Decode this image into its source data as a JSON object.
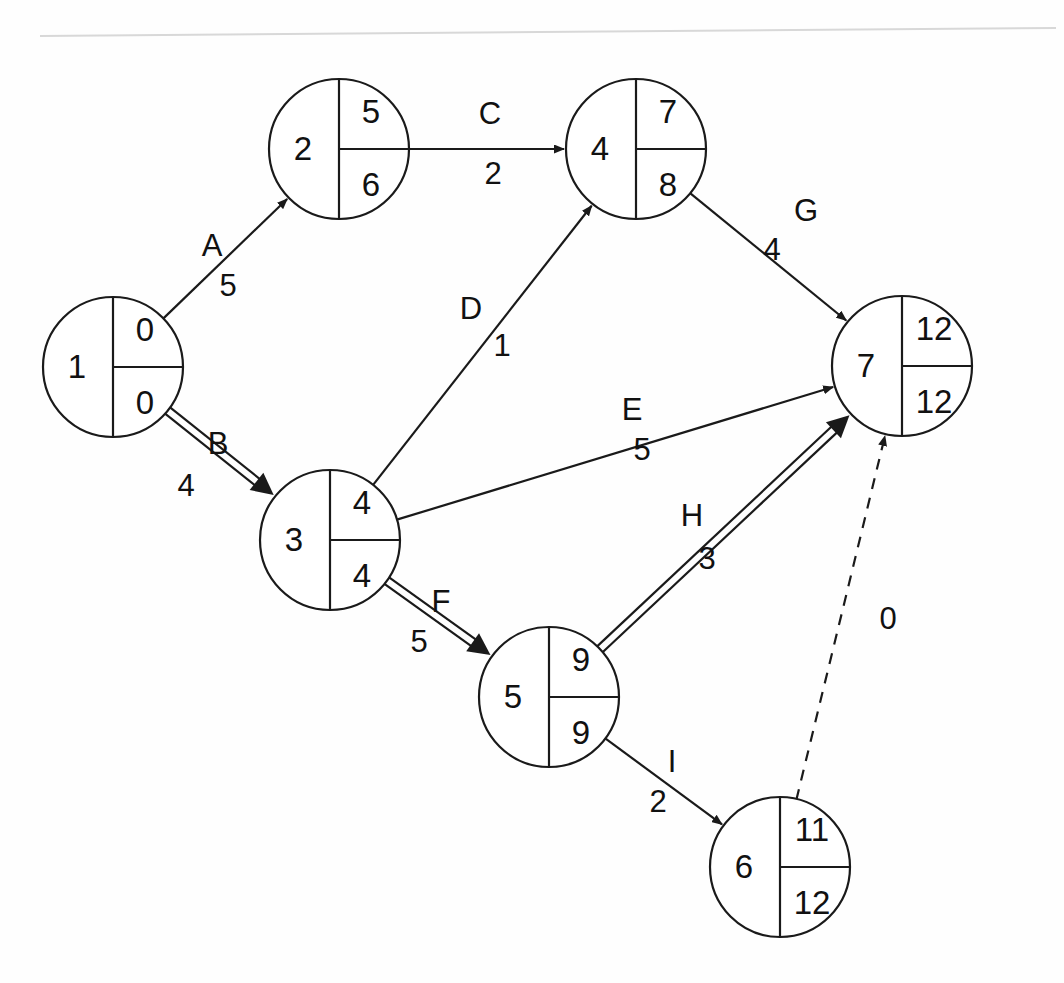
{
  "diagram": {
    "type": "aoa-network",
    "page_rule_visible": "true",
    "nodes": [
      {
        "id": "1",
        "label": "1",
        "early": "0",
        "late": "0",
        "cx": 113,
        "cy": 367,
        "r": 70
      },
      {
        "id": "2",
        "label": "2",
        "early": "5",
        "late": "6",
        "cx": 339,
        "cy": 149,
        "r": 70
      },
      {
        "id": "3",
        "label": "3",
        "early": "4",
        "late": "4",
        "cx": 330,
        "cy": 540,
        "r": 70
      },
      {
        "id": "4",
        "label": "4",
        "early": "7",
        "late": "8",
        "cx": 636,
        "cy": 149,
        "r": 70
      },
      {
        "id": "5",
        "label": "5",
        "early": "9",
        "late": "9",
        "cx": 549,
        "cy": 697,
        "r": 70
      },
      {
        "id": "6",
        "label": "6",
        "early": "11",
        "late": "12",
        "cx": 780,
        "cy": 867,
        "r": 70
      },
      {
        "id": "7",
        "label": "7",
        "early": "12",
        "late": "12",
        "cx": 902,
        "cy": 366,
        "r": 70
      }
    ],
    "edges": [
      {
        "id": "A",
        "label": "A",
        "duration": "5",
        "from": "1",
        "to": "2",
        "style": "single",
        "label_x": 212,
        "label_y": 248,
        "dur_x": 228,
        "dur_y": 288
      },
      {
        "id": "B",
        "label": "B",
        "duration": "4",
        "from": "1",
        "to": "3",
        "style": "double",
        "label_x": 218,
        "label_y": 446,
        "dur_x": 186,
        "dur_y": 488
      },
      {
        "id": "C",
        "label": "C",
        "duration": "2",
        "from": "2",
        "to": "4",
        "style": "single",
        "label_x": 490,
        "label_y": 116,
        "dur_x": 493,
        "dur_y": 176
      },
      {
        "id": "D",
        "label": "D",
        "duration": "1",
        "from": "3",
        "to": "4",
        "style": "single",
        "label_x": 471,
        "label_y": 311,
        "dur_x": 502,
        "dur_y": 348
      },
      {
        "id": "E",
        "label": "E",
        "duration": "5",
        "from": "3",
        "to": "7",
        "style": "single",
        "label_x": 632,
        "label_y": 412,
        "dur_x": 642,
        "dur_y": 452
      },
      {
        "id": "F",
        "label": "F",
        "duration": "5",
        "from": "3",
        "to": "5",
        "style": "double",
        "label_x": 441,
        "label_y": 604,
        "dur_x": 419,
        "dur_y": 644
      },
      {
        "id": "G",
        "label": "G",
        "duration": "4",
        "from": "4",
        "to": "7",
        "style": "single",
        "label_x": 806,
        "label_y": 213,
        "dur_x": 772,
        "dur_y": 252
      },
      {
        "id": "H",
        "label": "H",
        "duration": "3",
        "from": "5",
        "to": "7",
        "style": "double",
        "label_x": 692,
        "label_y": 518,
        "dur_x": 707,
        "dur_y": 561
      },
      {
        "id": "I",
        "label": "I",
        "duration": "2",
        "from": "5",
        "to": "6",
        "style": "single",
        "label_x": 672,
        "label_y": 764,
        "dur_x": 658,
        "dur_y": 804
      },
      {
        "id": "DUMMY",
        "label": "",
        "duration": "0",
        "from": "6",
        "to": "7",
        "style": "dashed",
        "label_x": 0,
        "label_y": 0,
        "dur_x": 888,
        "dur_y": 621
      }
    ],
    "legend": {
      "critical_path_note": "double-line arrows indicate the critical path",
      "dummy_note": "dashed arrow is a dummy activity of duration 0"
    }
  },
  "chart_data": {
    "type": "diagram",
    "nodes": [
      {
        "event": 1,
        "earliest": 0,
        "latest": 0,
        "slack": 0
      },
      {
        "event": 2,
        "earliest": 5,
        "latest": 6,
        "slack": 1
      },
      {
        "event": 3,
        "earliest": 4,
        "latest": 4,
        "slack": 0
      },
      {
        "event": 4,
        "earliest": 7,
        "latest": 8,
        "slack": 1
      },
      {
        "event": 5,
        "earliest": 9,
        "latest": 9,
        "slack": 0
      },
      {
        "event": 6,
        "earliest": 11,
        "latest": 12,
        "slack": 1
      },
      {
        "event": 7,
        "earliest": 12,
        "latest": 12,
        "slack": 0
      }
    ],
    "activities": [
      {
        "name": "A",
        "from": 1,
        "to": 2,
        "duration": 5,
        "critical": false
      },
      {
        "name": "B",
        "from": 1,
        "to": 3,
        "duration": 4,
        "critical": true
      },
      {
        "name": "C",
        "from": 2,
        "to": 4,
        "duration": 2,
        "critical": false
      },
      {
        "name": "D",
        "from": 3,
        "to": 4,
        "duration": 1,
        "critical": false
      },
      {
        "name": "E",
        "from": 3,
        "to": 7,
        "duration": 5,
        "critical": false
      },
      {
        "name": "F",
        "from": 3,
        "to": 5,
        "duration": 5,
        "critical": true
      },
      {
        "name": "G",
        "from": 4,
        "to": 7,
        "duration": 4,
        "critical": false
      },
      {
        "name": "H",
        "from": 5,
        "to": 7,
        "duration": 3,
        "critical": true
      },
      {
        "name": "I",
        "from": 5,
        "to": 6,
        "duration": 2,
        "critical": false
      },
      {
        "name": "dummy",
        "from": 6,
        "to": 7,
        "duration": 0,
        "critical": false
      }
    ],
    "critical_path": [
      "1",
      "3",
      "5",
      "7"
    ],
    "project_duration": 12
  }
}
